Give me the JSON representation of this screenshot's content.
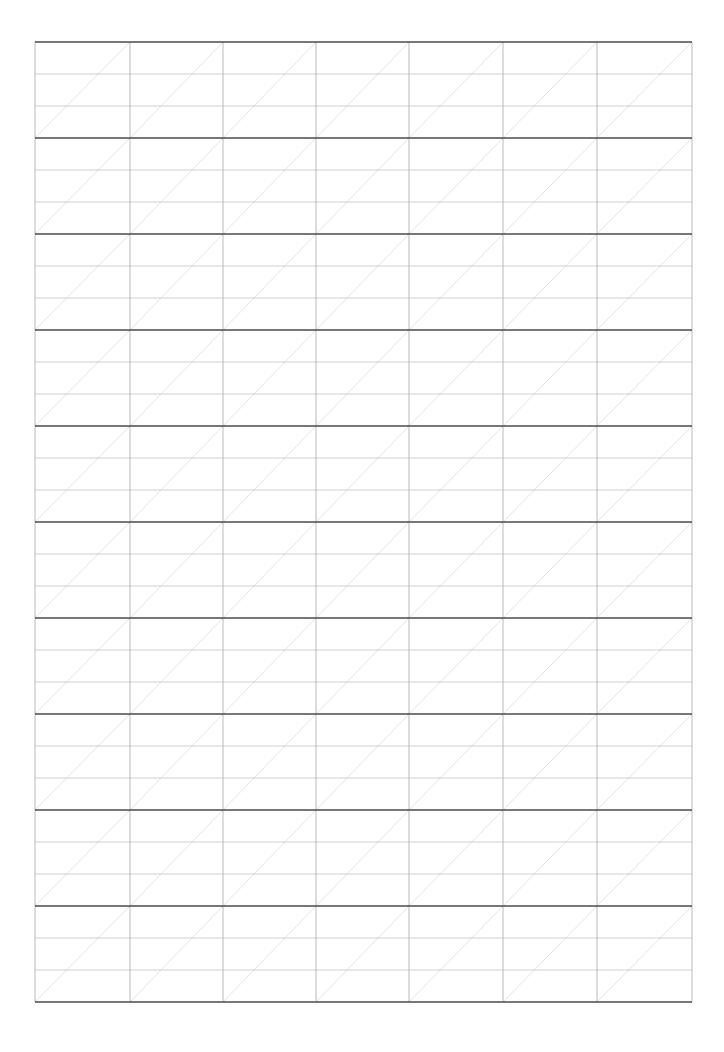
{
  "page": {
    "width": 724,
    "height": 1052,
    "background": "#ffffff"
  },
  "grid": {
    "left": 35,
    "top": 42,
    "right": 692,
    "columns": 7,
    "column_edges": [
      35,
      130,
      223,
      316,
      409,
      503,
      597,
      692
    ],
    "blocks": 10,
    "block_height": 96,
    "subrows_per_block": 3,
    "diagonal_direction": "bottom-left-to-top-right",
    "colors": {
      "block_line": "#4a4a4a",
      "subrow_line": "#c4c4c4",
      "column_line": "#a8a8a8",
      "outer_border": "#a8a8a8",
      "diagonal": "#d6d6d6"
    },
    "stroke_widths": {
      "block_line": 1.6,
      "subrow_line": 0.8,
      "column_line": 0.8,
      "diagonal": 0.7
    }
  }
}
